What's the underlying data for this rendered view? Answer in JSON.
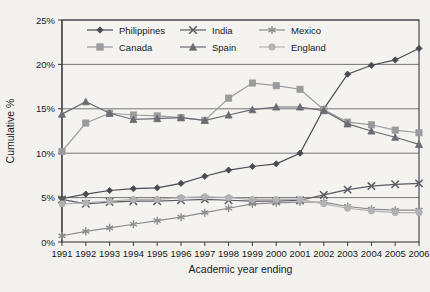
{
  "chart_data": {
    "type": "line",
    "title": "",
    "xlabel": "Academic year ending",
    "ylabel": "Cumulative %",
    "grid": true,
    "legend_position": "top-inside",
    "xlim": [
      1991,
      2006
    ],
    "ylim": [
      0,
      25
    ],
    "ytick_labels": [
      "0%",
      "5%",
      "10%",
      "15%",
      "20%",
      "25%"
    ],
    "ytick_values": [
      0,
      5,
      10,
      15,
      20,
      25
    ],
    "categories": [
      1991,
      1992,
      1993,
      1994,
      1995,
      1996,
      1997,
      1998,
      1999,
      2000,
      2001,
      2002,
      2003,
      2004,
      2005,
      2006
    ],
    "xtick_labels": [
      "1991",
      "1992",
      "1993",
      "1994",
      "1995",
      "1996",
      "1997",
      "1998",
      "1999",
      "2000",
      "2001",
      "2002",
      "2003",
      "2004",
      "2005",
      "2006"
    ],
    "series": [
      {
        "name": "Philippines",
        "marker": "diamond",
        "color": "#4a4a52",
        "values": [
          4.9,
          5.4,
          5.8,
          6.0,
          6.1,
          6.6,
          7.4,
          8.1,
          8.5,
          8.8,
          10.0,
          15.0,
          18.9,
          19.9,
          20.5,
          21.8
        ]
      },
      {
        "name": "India",
        "marker": "x",
        "color": "#5a5a62",
        "values": [
          4.8,
          4.3,
          4.5,
          4.6,
          4.6,
          4.7,
          4.8,
          4.7,
          4.6,
          4.6,
          4.7,
          5.3,
          5.9,
          6.3,
          6.5,
          6.6
        ]
      },
      {
        "name": "Mexico",
        "marker": "asterisk",
        "color": "#8d8d90",
        "values": [
          0.7,
          1.2,
          1.6,
          2.0,
          2.4,
          2.8,
          3.3,
          3.8,
          4.3,
          4.4,
          4.5,
          4.5,
          4.0,
          3.7,
          3.6,
          3.6
        ]
      },
      {
        "name": "Canada",
        "marker": "square",
        "color": "#9b9b9e",
        "values": [
          10.2,
          13.4,
          14.5,
          14.3,
          14.2,
          14.0,
          13.7,
          16.2,
          17.9,
          17.6,
          17.2,
          14.9,
          13.5,
          13.2,
          12.6,
          12.3
        ]
      },
      {
        "name": "Spain",
        "marker": "triangle",
        "color": "#6b6b73",
        "values": [
          14.4,
          15.8,
          14.5,
          13.8,
          13.9,
          14.0,
          13.7,
          14.3,
          14.9,
          15.2,
          15.2,
          14.8,
          13.3,
          12.5,
          11.8,
          11.0
        ]
      },
      {
        "name": "England",
        "marker": "circle",
        "color": "#b2b2b4",
        "values": [
          4.3,
          4.4,
          4.6,
          4.8,
          4.8,
          5.0,
          5.1,
          5.0,
          4.8,
          4.8,
          4.8,
          4.3,
          3.8,
          3.5,
          3.3,
          3.3
        ]
      }
    ]
  }
}
